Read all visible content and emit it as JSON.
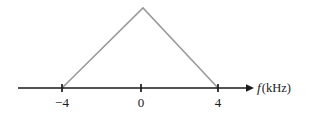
{
  "figure": {
    "type": "spectrum-plot",
    "background_color": "#ffffff",
    "axis": {
      "label_variable": "f",
      "label_unit": "(kHz)",
      "label_full": "f (kHz)",
      "line_color": "#1a1a1a",
      "arrow": "right-arrow-icon",
      "x_start_px": 18,
      "x_end_px": 250,
      "y_px": 88,
      "tick_color": "#1a1a1a"
    },
    "ticks": [
      {
        "label": "−4",
        "value": -4,
        "x_px": 62
      },
      {
        "label": "0",
        "value": 0,
        "x_px": 141
      },
      {
        "label": "4",
        "value": 4,
        "x_px": 218
      }
    ],
    "trace": {
      "name": "triangular-spectrum",
      "color": "#9a9a9a",
      "stroke_width": 1.6,
      "apex_x_px": 143,
      "apex_y_px": 8,
      "left_base_x_px": 62,
      "right_base_x_px": 218,
      "base_y_px": 88
    }
  },
  "chart_data": {
    "type": "line",
    "title": "",
    "xlabel": "f (kHz)",
    "ylabel": "",
    "xlim": [
      -6.5,
      5.6
    ],
    "ylim": [
      0,
      1
    ],
    "grid": false,
    "legend": null,
    "xticks": [
      -4,
      0,
      4
    ],
    "xticklabels": [
      "−4",
      "0",
      "4"
    ],
    "yticks": [],
    "series": [
      {
        "name": "triangular-spectrum",
        "color": "#9a9a9a",
        "x": [
          -4,
          0,
          4
        ],
        "y": [
          0,
          1,
          0
        ]
      }
    ],
    "annotations": []
  }
}
